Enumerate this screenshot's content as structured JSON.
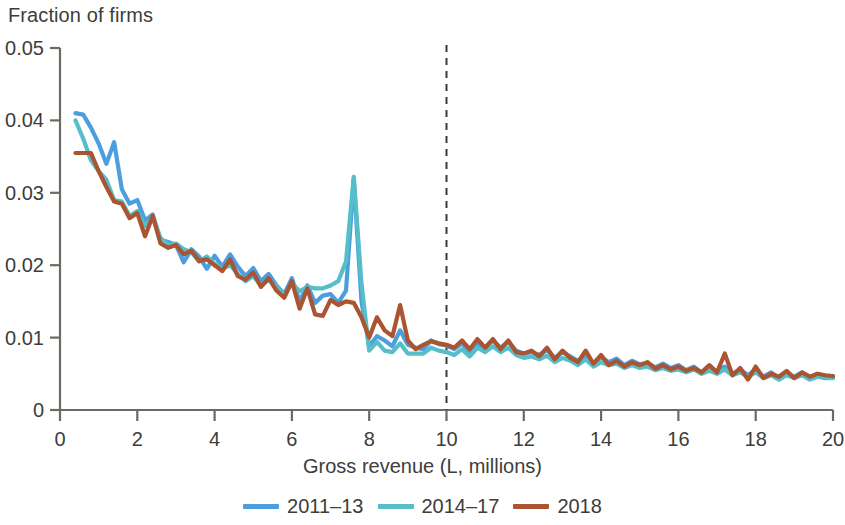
{
  "chart_data": {
    "type": "line",
    "title": "",
    "ylabel": "Fraction of firms",
    "xlabel": "Gross revenue (L, millions)",
    "xlim": [
      0,
      20
    ],
    "ylim": [
      0,
      0.05
    ],
    "xticks": [
      0,
      2,
      4,
      6,
      8,
      10,
      12,
      14,
      16,
      18,
      20
    ],
    "xtick_labels": [
      "0",
      "2",
      "4",
      "6",
      "8",
      "10",
      "12",
      "14",
      "16",
      "18",
      "20"
    ],
    "yticks": [
      0,
      0.01,
      0.02,
      0.03,
      0.04,
      0.05
    ],
    "ytick_labels": [
      "0",
      "0.01",
      "0.02",
      "0.03",
      "0.04",
      "0.05"
    ],
    "grid": false,
    "legend_position": "below",
    "annotations": [
      {
        "type": "vline",
        "x": 10,
        "style": "dashed",
        "color": "#3b3b3b",
        "label": ""
      }
    ],
    "colors": {
      "series_2011_13": "#4d9ede",
      "series_2014_17": "#55bec9",
      "series_2018": "#ab5431",
      "axis": "#6b6b63",
      "text": "#3d3d3b",
      "threshold_line": "#3b3b3b"
    },
    "x": [
      0.4,
      0.6,
      0.8,
      1.0,
      1.2,
      1.4,
      1.6,
      1.8,
      2.0,
      2.2,
      2.4,
      2.6,
      2.8,
      3.0,
      3.2,
      3.4,
      3.6,
      3.8,
      4.0,
      4.2,
      4.4,
      4.6,
      4.8,
      5.0,
      5.2,
      5.4,
      5.6,
      5.8,
      6.0,
      6.2,
      6.4,
      6.6,
      6.8,
      7.0,
      7.2,
      7.4,
      7.6,
      7.8,
      8.0,
      8.2,
      8.4,
      8.6,
      8.8,
      9.0,
      9.2,
      9.4,
      9.6,
      9.8,
      10.0,
      10.2,
      10.4,
      10.6,
      10.8,
      11.0,
      11.2,
      11.4,
      11.6,
      11.8,
      12.0,
      12.2,
      12.4,
      12.6,
      12.8,
      13.0,
      13.2,
      13.4,
      13.6,
      13.8,
      14.0,
      14.2,
      14.4,
      14.6,
      14.8,
      15.0,
      15.2,
      15.4,
      15.6,
      15.8,
      16.0,
      16.2,
      16.4,
      16.6,
      16.8,
      17.0,
      17.2,
      17.4,
      17.6,
      17.8,
      18.0,
      18.2,
      18.4,
      18.6,
      18.8,
      19.0,
      19.2,
      19.4,
      19.6,
      19.8,
      20.0
    ],
    "series": [
      {
        "name": "2011–13",
        "color": "#4d9ede",
        "values": [
          0.041,
          0.0408,
          0.039,
          0.0368,
          0.034,
          0.037,
          0.0305,
          0.0285,
          0.029,
          0.0262,
          0.027,
          0.0235,
          0.0232,
          0.0228,
          0.0204,
          0.0222,
          0.0212,
          0.0195,
          0.0213,
          0.0198,
          0.0215,
          0.0198,
          0.0185,
          0.0196,
          0.0178,
          0.0188,
          0.0172,
          0.016,
          0.0182,
          0.015,
          0.0172,
          0.0148,
          0.0158,
          0.016,
          0.0148,
          0.0165,
          0.032,
          0.015,
          0.0088,
          0.0102,
          0.0096,
          0.0088,
          0.011,
          0.009,
          0.0086,
          0.0084,
          0.0096,
          0.0091,
          0.0089,
          0.0084,
          0.0092,
          0.008,
          0.0092,
          0.0086,
          0.0096,
          0.0086,
          0.0094,
          0.0082,
          0.0078,
          0.008,
          0.0076,
          0.0083,
          0.0072,
          0.008,
          0.0074,
          0.0068,
          0.0075,
          0.0064,
          0.0073,
          0.0066,
          0.0071,
          0.0062,
          0.0068,
          0.0063,
          0.0065,
          0.0059,
          0.0064,
          0.0058,
          0.0062,
          0.0055,
          0.006,
          0.0052,
          0.0058,
          0.0054,
          0.006,
          0.005,
          0.0056,
          0.0048,
          0.0056,
          0.0046,
          0.0052,
          0.0044,
          0.005,
          0.0046,
          0.0052,
          0.0044,
          0.005,
          0.0046,
          0.0046
        ]
      },
      {
        "name": "2014–17",
        "color": "#55bec9",
        "values": [
          0.04,
          0.0375,
          0.0345,
          0.033,
          0.0318,
          0.029,
          0.0288,
          0.0268,
          0.0275,
          0.0254,
          0.0266,
          0.0238,
          0.0228,
          0.023,
          0.0222,
          0.0218,
          0.0205,
          0.0212,
          0.0202,
          0.0195,
          0.02,
          0.0188,
          0.0178,
          0.0185,
          0.0172,
          0.018,
          0.017,
          0.0158,
          0.0175,
          0.0164,
          0.017,
          0.0168,
          0.0168,
          0.0172,
          0.0178,
          0.0205,
          0.0322,
          0.0175,
          0.0082,
          0.0094,
          0.0082,
          0.008,
          0.0092,
          0.0078,
          0.0078,
          0.0078,
          0.0086,
          0.0082,
          0.008,
          0.0076,
          0.0084,
          0.0074,
          0.0086,
          0.008,
          0.0088,
          0.008,
          0.0086,
          0.0076,
          0.0072,
          0.0074,
          0.007,
          0.0075,
          0.0066,
          0.0072,
          0.0068,
          0.0062,
          0.007,
          0.006,
          0.0066,
          0.0062,
          0.0064,
          0.0058,
          0.0062,
          0.0058,
          0.006,
          0.0055,
          0.0058,
          0.0054,
          0.0056,
          0.0052,
          0.0056,
          0.005,
          0.0054,
          0.005,
          0.0056,
          0.0048,
          0.0052,
          0.0046,
          0.0052,
          0.0044,
          0.0048,
          0.0042,
          0.0048,
          0.0044,
          0.0048,
          0.0042,
          0.0046,
          0.0044,
          0.0044
        ]
      },
      {
        "name": "2018",
        "color": "#ab5431",
        "values": [
          0.0355,
          0.0355,
          0.0355,
          0.033,
          0.0308,
          0.0288,
          0.0285,
          0.0265,
          0.0272,
          0.024,
          0.0268,
          0.023,
          0.0224,
          0.0228,
          0.0215,
          0.022,
          0.0206,
          0.0208,
          0.02,
          0.0192,
          0.0208,
          0.0185,
          0.018,
          0.019,
          0.017,
          0.0182,
          0.0165,
          0.0155,
          0.0178,
          0.014,
          0.0168,
          0.0132,
          0.013,
          0.0152,
          0.0145,
          0.015,
          0.0148,
          0.0128,
          0.01,
          0.0128,
          0.011,
          0.0102,
          0.0145,
          0.0096,
          0.0084,
          0.009,
          0.0095,
          0.0092,
          0.009,
          0.0086,
          0.0096,
          0.0084,
          0.0098,
          0.0086,
          0.0098,
          0.0084,
          0.0096,
          0.008,
          0.0078,
          0.0082,
          0.0074,
          0.0086,
          0.007,
          0.0082,
          0.0072,
          0.0066,
          0.0082,
          0.0064,
          0.0076,
          0.0062,
          0.0068,
          0.006,
          0.0066,
          0.0062,
          0.0066,
          0.0057,
          0.0062,
          0.0056,
          0.006,
          0.0054,
          0.0058,
          0.0052,
          0.0062,
          0.0052,
          0.0078,
          0.0048,
          0.0058,
          0.0042,
          0.006,
          0.0044,
          0.005,
          0.0046,
          0.0054,
          0.0044,
          0.0052,
          0.0046,
          0.005,
          0.0048,
          0.0047
        ]
      }
    ]
  },
  "legend": {
    "entries": [
      {
        "label": "2011–13",
        "color": "#4d9ede"
      },
      {
        "label": "2014–17",
        "color": "#55bec9"
      },
      {
        "label": "2018",
        "color": "#ab5431"
      }
    ]
  }
}
